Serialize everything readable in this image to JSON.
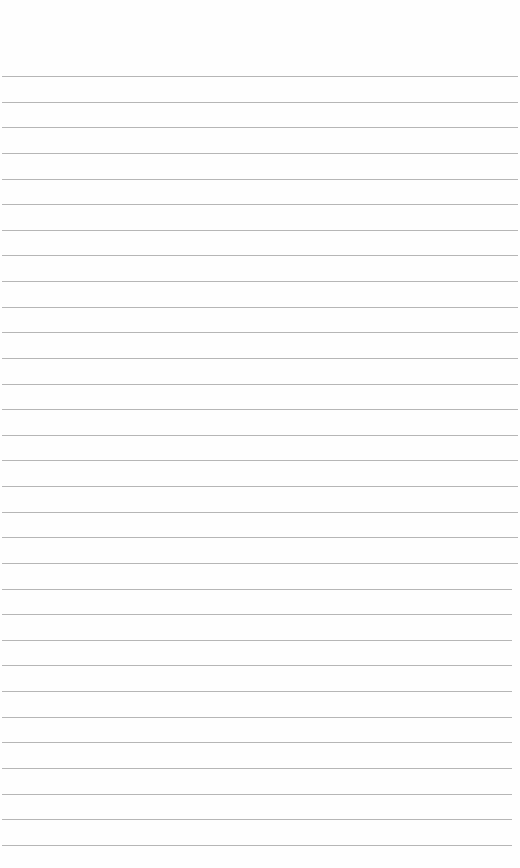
{
  "page": {
    "type": "lined-paper",
    "background_color": "#fefefe",
    "line_color": "#a9a9a9",
    "line_count": 31,
    "first_line_y": 76,
    "line_spacing": 25.63,
    "text": ""
  }
}
